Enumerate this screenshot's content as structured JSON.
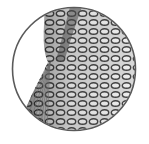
{
  "illustration": {
    "subject": "circular mesh net pattern",
    "colors": {
      "background": "#ffffff",
      "outline": "#5a5a5a",
      "mesh_dark": "#3a3a3a",
      "mesh_mid": "#7a7a7a",
      "mesh_light": "#b0b0b0"
    },
    "circle": {
      "cx": 74,
      "cy": 69,
      "r": 62
    }
  }
}
